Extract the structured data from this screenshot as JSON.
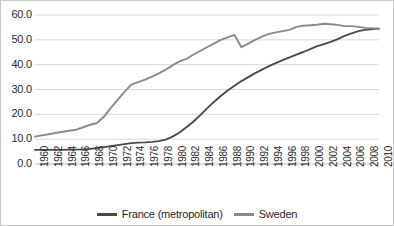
{
  "chart_data": {
    "type": "line",
    "title": "",
    "xlabel": "",
    "ylabel": "",
    "xlim": [
      1960,
      2010
    ],
    "ylim": [
      0.0,
      60.0
    ],
    "grid": true,
    "legend_position": "bottom",
    "y_ticks": [
      "0.0",
      "10.0",
      "20.0",
      "30.0",
      "40.0",
      "50.0",
      "60.0"
    ],
    "y_tick_values": [
      0.0,
      10.0,
      20.0,
      30.0,
      40.0,
      50.0,
      60.0
    ],
    "x_ticks": [
      "1960",
      "1962",
      "1964",
      "1966",
      "1968",
      "1970",
      "1972",
      "1974",
      "1976",
      "1978",
      "1980",
      "1982",
      "1984",
      "1986",
      "1988",
      "1990",
      "1992",
      "1994",
      "1996",
      "1998",
      "2000",
      "2002",
      "2004",
      "2006",
      "2008",
      "2010"
    ],
    "x": [
      1960,
      1961,
      1962,
      1963,
      1964,
      1965,
      1966,
      1967,
      1968,
      1969,
      1970,
      1971,
      1972,
      1973,
      1974,
      1975,
      1976,
      1977,
      1978,
      1979,
      1980,
      1981,
      1982,
      1983,
      1984,
      1985,
      1986,
      1987,
      1988,
      1989,
      1990,
      1991,
      1992,
      1993,
      1994,
      1995,
      1996,
      1997,
      1998,
      1999,
      2000,
      2001,
      2002,
      2003,
      2004,
      2005,
      2006,
      2007,
      2008,
      2009,
      2010
    ],
    "series": [
      {
        "name": "France (metropolitan)",
        "color": "#4a4a4a",
        "values": [
          5.7,
          5.7,
          5.7,
          5.7,
          5.7,
          5.8,
          5.8,
          5.9,
          6.1,
          6.4,
          6.8,
          7.2,
          7.6,
          8.0,
          8.4,
          8.6,
          8.7,
          8.9,
          9.2,
          9.8,
          11.0,
          12.7,
          14.8,
          17.0,
          19.6,
          22.4,
          25.0,
          27.4,
          29.6,
          31.5,
          33.4,
          35.0,
          36.6,
          38.0,
          39.4,
          40.6,
          41.8,
          42.9,
          44.0,
          45.1,
          46.3,
          47.5,
          48.3,
          49.2,
          50.3,
          51.6,
          52.6,
          53.5,
          54.0,
          54.3,
          54.5
        ]
      },
      {
        "name": "Sweden",
        "color": "#8a8a8a",
        "values": [
          11.0,
          11.5,
          12.0,
          12.5,
          13.0,
          13.4,
          13.8,
          14.8,
          15.8,
          16.5,
          19.0,
          22.5,
          25.8,
          29.0,
          32.0,
          33.0,
          34.0,
          35.2,
          36.5,
          38.0,
          39.7,
          41.3,
          42.3,
          44.0,
          45.5,
          47.0,
          48.5,
          50.0,
          51.0,
          52.0,
          47.0,
          48.5,
          50.0,
          51.3,
          52.4,
          53.0,
          53.5,
          54.0,
          55.2,
          55.7,
          55.9,
          56.1,
          56.5,
          56.3,
          56.0,
          55.5,
          55.5,
          55.2,
          54.8,
          54.7,
          54.5
        ]
      }
    ]
  },
  "legend": {
    "entries": [
      {
        "label": "France (metropolitan)",
        "color": "#4a4a4a"
      },
      {
        "label": "Sweden",
        "color": "#8a8a8a"
      }
    ]
  }
}
